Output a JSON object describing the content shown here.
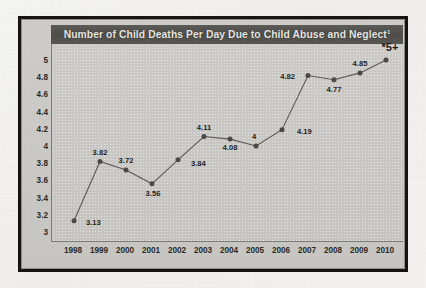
{
  "chart_data": {
    "type": "line",
    "title": "Number of Child Deaths Per Day Due to Child Abuse and Neglect",
    "title_superscript": "1",
    "xlabel": "",
    "ylabel": "",
    "categories": [
      "1998",
      "1999",
      "2000",
      "2001",
      "2002",
      "2003",
      "2004",
      "2005",
      "2006",
      "2007",
      "2008",
      "2009",
      "2010"
    ],
    "values": [
      3.13,
      3.82,
      3.72,
      3.56,
      3.84,
      4.11,
      4.08,
      4.0,
      4.19,
      4.82,
      4.77,
      4.85,
      5.0
    ],
    "point_labels": [
      "3.13",
      "3.82",
      "3.72",
      "3.56",
      "3.84",
      "4.11",
      "4.08",
      "4",
      "4.19",
      "4.82",
      "4.77",
      "4.85",
      "*5+"
    ],
    "ylim": [
      3,
      5
    ],
    "yticks": [
      "3",
      "3.2",
      "3.4",
      "3.6",
      "3.8",
      "4",
      "4.2",
      "4.4",
      "4.6",
      "4.8",
      "5"
    ],
    "ytick_values": [
      3,
      3.2,
      3.4,
      3.6,
      3.8,
      4,
      4.2,
      4.4,
      4.6,
      4.8,
      5
    ],
    "grid": false,
    "legend": "none",
    "series_color": "#5a5954",
    "marker_color": "#4a4944",
    "title_band_color": "#4e4d49",
    "title_text_color": "#e7e6e2",
    "plot_background": "#c8c7c3",
    "frame_color": "#16140f"
  }
}
